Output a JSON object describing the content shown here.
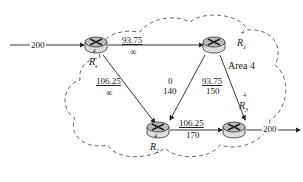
{
  "diagram": {
    "area_label": "Area 4",
    "routers": [
      {
        "id": "Rs",
        "base": "R",
        "sub": "s",
        "sup": "4"
      },
      {
        "id": "R1",
        "base": "R",
        "sub": "1",
        "sup": "4"
      },
      {
        "id": "R2",
        "base": "R",
        "sub": "2",
        "sup": "4"
      },
      {
        "id": "R3",
        "base": "R",
        "sub": "3",
        "sup": "4"
      }
    ],
    "links": [
      {
        "from": "source",
        "to": "Rs",
        "label": "200"
      },
      {
        "from": "Rs",
        "to": "R1",
        "top": "93.75",
        "bottom": "∞"
      },
      {
        "from": "Rs",
        "to": "R2",
        "top": "106.25",
        "bottom": "∞"
      },
      {
        "from": "R1",
        "to": "R2",
        "top": "0",
        "bottom": "140"
      },
      {
        "from": "R1",
        "to": "R3",
        "top": "93.75",
        "bottom": "150"
      },
      {
        "from": "R2",
        "to": "R3",
        "top": "106.25",
        "bottom": "170"
      },
      {
        "from": "R3",
        "to": "sink",
        "label": "200"
      }
    ]
  }
}
